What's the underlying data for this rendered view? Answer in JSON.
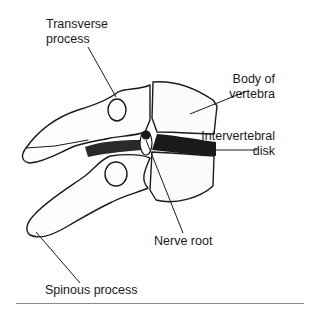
{
  "diagram": {
    "type": "anatomical-illustration",
    "labels": {
      "transverse_process_line1": "Transverse",
      "transverse_process_line2": "process",
      "body_line1": "Body of",
      "body_line2": "vertebra",
      "disk_line1": "Intervertebral",
      "disk_line2": "disk",
      "nerve_root": "Nerve root",
      "spinous_process": "Spinous process"
    },
    "colors": {
      "ink": "#1a1a1a",
      "rule": "#8a8a8a",
      "background": "#ffffff"
    }
  }
}
